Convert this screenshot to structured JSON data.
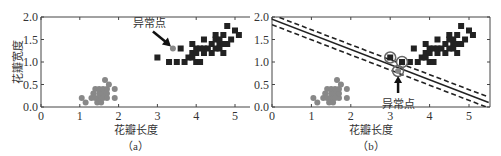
{
  "chart_data": [
    {
      "type": "scatter",
      "panel": "a",
      "caption": "（a）",
      "title": "",
      "xlabel": "花瓣长度",
      "ylabel": "花瓣宽度",
      "xlim": [
        0,
        5.4
      ],
      "ylim": [
        0,
        2.0
      ],
      "xticks": [
        "0",
        "1",
        "2",
        "3",
        "4",
        "5"
      ],
      "yticks": [
        "0.0",
        "0.5",
        "1.0",
        "1.5",
        "2.0"
      ],
      "grid": false,
      "annotation": {
        "text": "异常点",
        "target": [
          3.4,
          1.3
        ]
      },
      "series": [
        {
          "name": "class_circle",
          "marker": "circle",
          "color": "#888888",
          "points": [
            [
              1.05,
              0.2
            ],
            [
              1.15,
              0.1
            ],
            [
              1.3,
              0.2
            ],
            [
              1.35,
              0.3
            ],
            [
              1.4,
              0.2
            ],
            [
              1.4,
              0.4
            ],
            [
              1.45,
              0.1
            ],
            [
              1.5,
              0.2
            ],
            [
              1.5,
              0.3
            ],
            [
              1.5,
              0.4
            ],
            [
              1.55,
              0.1
            ],
            [
              1.55,
              0.2
            ],
            [
              1.6,
              0.2
            ],
            [
              1.6,
              0.3
            ],
            [
              1.6,
              0.4
            ],
            [
              1.65,
              0.6
            ],
            [
              1.7,
              0.2
            ],
            [
              1.7,
              0.3
            ],
            [
              1.7,
              0.4
            ],
            [
              1.75,
              0.5
            ],
            [
              1.9,
              0.2
            ],
            [
              1.9,
              0.4
            ],
            [
              3.4,
              1.3
            ]
          ]
        },
        {
          "name": "class_square",
          "marker": "square",
          "color": "#222222",
          "points": [
            [
              3.0,
              1.1
            ],
            [
              3.3,
              1.0
            ],
            [
              3.5,
              1.0
            ],
            [
              3.6,
              1.3
            ],
            [
              3.7,
              1.0
            ],
            [
              3.8,
              1.1
            ],
            [
              3.9,
              1.1
            ],
            [
              3.9,
              1.2
            ],
            [
              3.9,
              1.4
            ],
            [
              4.0,
              1.0
            ],
            [
              4.0,
              1.2
            ],
            [
              4.0,
              1.3
            ],
            [
              4.1,
              1.0
            ],
            [
              4.1,
              1.3
            ],
            [
              4.2,
              1.2
            ],
            [
              4.2,
              1.3
            ],
            [
              4.2,
              1.5
            ],
            [
              4.3,
              1.3
            ],
            [
              4.4,
              1.2
            ],
            [
              4.4,
              1.4
            ],
            [
              4.5,
              1.3
            ],
            [
              4.5,
              1.5
            ],
            [
              4.5,
              1.6
            ],
            [
              4.6,
              1.3
            ],
            [
              4.6,
              1.4
            ],
            [
              4.6,
              1.5
            ],
            [
              4.7,
              1.2
            ],
            [
              4.7,
              1.4
            ],
            [
              4.7,
              1.6
            ],
            [
              4.8,
              1.4
            ],
            [
              4.8,
              1.8
            ],
            [
              4.9,
              1.5
            ],
            [
              5.0,
              1.7
            ],
            [
              5.1,
              1.6
            ]
          ]
        }
      ]
    },
    {
      "type": "scatter",
      "panel": "b",
      "caption": "（b）",
      "title": "",
      "xlabel": "花瓣长度",
      "ylabel": "",
      "xlim": [
        0,
        5.5
      ],
      "ylim": [
        0,
        2.0
      ],
      "xticks": [
        "0",
        "1",
        "2",
        "3",
        "4",
        "5"
      ],
      "yticks": [
        "0.0",
        "0.5",
        "1.0",
        "1.5",
        "2.0"
      ],
      "grid": false,
      "annotation": {
        "text": "异常点",
        "target": [
          3.2,
          0.8
        ]
      },
      "decision_boundary": {
        "solid": [
          [
            0,
            1.95
          ],
          [
            5.5,
            0.1
          ]
        ],
        "margin_upper": [
          [
            0,
            2.05
          ],
          [
            5.5,
            0.22
          ]
        ],
        "margin_lower": [
          [
            0,
            1.83
          ],
          [
            5.5,
            -0.02
          ]
        ]
      },
      "support_vectors": [
        [
          3.0,
          1.1
        ],
        [
          3.3,
          1.0
        ],
        [
          3.2,
          0.8
        ]
      ],
      "series": [
        {
          "name": "class_circle",
          "marker": "circle",
          "color": "#888888",
          "points": [
            [
              1.05,
              0.2
            ],
            [
              1.15,
              0.1
            ],
            [
              1.3,
              0.2
            ],
            [
              1.35,
              0.3
            ],
            [
              1.4,
              0.2
            ],
            [
              1.4,
              0.4
            ],
            [
              1.45,
              0.1
            ],
            [
              1.5,
              0.2
            ],
            [
              1.5,
              0.3
            ],
            [
              1.5,
              0.4
            ],
            [
              1.55,
              0.1
            ],
            [
              1.55,
              0.2
            ],
            [
              1.6,
              0.2
            ],
            [
              1.6,
              0.3
            ],
            [
              1.6,
              0.4
            ],
            [
              1.65,
              0.6
            ],
            [
              1.7,
              0.2
            ],
            [
              1.7,
              0.3
            ],
            [
              1.7,
              0.4
            ],
            [
              1.75,
              0.5
            ],
            [
              1.9,
              0.2
            ],
            [
              1.9,
              0.4
            ],
            [
              3.2,
              0.8
            ]
          ]
        },
        {
          "name": "class_square",
          "marker": "square",
          "color": "#222222",
          "points": [
            [
              3.0,
              1.1
            ],
            [
              3.3,
              1.0
            ],
            [
              3.5,
              1.0
            ],
            [
              3.6,
              1.3
            ],
            [
              3.7,
              1.0
            ],
            [
              3.8,
              1.1
            ],
            [
              3.9,
              1.1
            ],
            [
              3.9,
              1.2
            ],
            [
              3.9,
              1.4
            ],
            [
              4.0,
              1.0
            ],
            [
              4.0,
              1.2
            ],
            [
              4.0,
              1.3
            ],
            [
              4.1,
              1.0
            ],
            [
              4.1,
              1.3
            ],
            [
              4.2,
              1.2
            ],
            [
              4.2,
              1.3
            ],
            [
              4.2,
              1.5
            ],
            [
              4.3,
              1.3
            ],
            [
              4.4,
              1.2
            ],
            [
              4.4,
              1.4
            ],
            [
              4.5,
              1.3
            ],
            [
              4.5,
              1.5
            ],
            [
              4.5,
              1.6
            ],
            [
              4.6,
              1.3
            ],
            [
              4.6,
              1.4
            ],
            [
              4.6,
              1.5
            ],
            [
              4.7,
              1.2
            ],
            [
              4.7,
              1.4
            ],
            [
              4.7,
              1.6
            ],
            [
              4.8,
              1.4
            ],
            [
              4.8,
              1.8
            ],
            [
              4.9,
              1.5
            ],
            [
              5.0,
              1.7
            ],
            [
              5.1,
              1.6
            ]
          ]
        }
      ]
    }
  ]
}
